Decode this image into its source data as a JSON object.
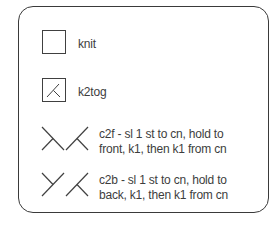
{
  "legend": {
    "items": [
      {
        "symbol": "empty-square",
        "label": "knit"
      },
      {
        "symbol": "k2tog-square",
        "label": "k2tog"
      },
      {
        "symbol": "cable-2-front",
        "label_line1": "c2f - sl 1 st to cn, hold to",
        "label_line2": "front, k1, then k1 from cn"
      },
      {
        "symbol": "cable-2-back",
        "label_line1": "c2b - sl 1 st to cn, hold to",
        "label_line2": "back, k1, then k1 from cn"
      }
    ]
  },
  "colors": {
    "stroke": "#404040",
    "text": "#3d3d3d",
    "background": "#ffffff"
  }
}
